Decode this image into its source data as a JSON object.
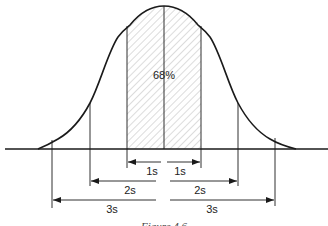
{
  "diagram": {
    "type": "normal-distribution",
    "center_label": "68%",
    "intervals": [
      {
        "name": "1s",
        "left_label": "1s",
        "right_label": "1s"
      },
      {
        "name": "2s",
        "left_label": "2s",
        "right_label": "2s"
      },
      {
        "name": "3s",
        "left_label": "3s",
        "right_label": "3s"
      }
    ],
    "caption": "Figure 4.6",
    "colors": {
      "stroke": "#1a1a1a",
      "hatch": "#9a9a9a",
      "background": "#ffffff"
    }
  }
}
